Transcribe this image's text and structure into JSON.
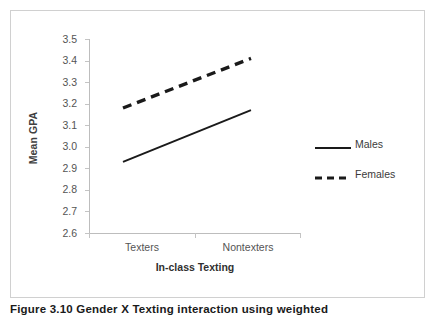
{
  "figure": {
    "caption": "Figure 3.10 Gender X Texting interaction using weighted"
  },
  "chart_data": {
    "type": "line",
    "title": "",
    "xlabel": "In-class Texting",
    "ylabel": "Mean GPA",
    "categories": [
      "Texters",
      "Nontexters"
    ],
    "series": [
      {
        "name": "Males",
        "values": [
          2.93,
          3.17
        ],
        "style": "solid",
        "color": "#1a1a1a"
      },
      {
        "name": "Females",
        "values": [
          3.18,
          3.41
        ],
        "style": "dashed",
        "color": "#1a1a1a"
      }
    ],
    "ylim": [
      2.6,
      3.5
    ],
    "ytick_labels": [
      "3.5",
      "3.4",
      "3.3",
      "3.2",
      "3.1",
      "3.0",
      "2.9",
      "2.8",
      "2.7",
      "2.6"
    ],
    "ytick_values": [
      3.5,
      3.4,
      3.3,
      3.2,
      3.1,
      3.0,
      2.9,
      2.8,
      2.7,
      2.6
    ],
    "grid": false,
    "legend_position": "right",
    "axis_color": "#bdbdbd"
  }
}
